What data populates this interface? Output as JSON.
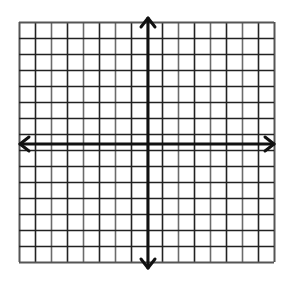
{
  "diagram": {
    "type": "coordinate-grid",
    "title": "",
    "grid": {
      "left": 19,
      "top": 22,
      "right": 274,
      "bottom": 262,
      "columns": 16,
      "rows": 15,
      "line_color": "#222222",
      "minor_shade": "#6b6b6b",
      "border_color": "#555555"
    },
    "axes": {
      "x_axis_y": 144,
      "y_axis_x": 148,
      "arrow_extent": {
        "left": 20,
        "right": 274,
        "top": 18,
        "bottom": 268
      },
      "color": "#111111",
      "width": 3,
      "arrows": [
        "left",
        "right",
        "up",
        "down"
      ]
    },
    "labels": []
  }
}
